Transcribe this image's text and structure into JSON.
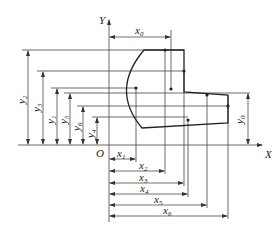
{
  "diagram": {
    "axes": {
      "x_label": "X",
      "y_label": "Y",
      "origin_label": "O"
    },
    "top_dimension": {
      "label": "x",
      "sub": "0"
    },
    "right_dimension": {
      "label": "y",
      "sub": "0"
    },
    "x_dimensions": [
      {
        "label": "x",
        "sub": "1"
      },
      {
        "label": "x",
        "sub": "2"
      },
      {
        "label": "x",
        "sub": "3"
      },
      {
        "label": "x",
        "sub": "4"
      },
      {
        "label": "x",
        "sub": "5"
      },
      {
        "label": "x",
        "sub": "6"
      }
    ],
    "y_dimensions": [
      {
        "label": "y",
        "sub": "2"
      },
      {
        "label": "y",
        "sub": "3"
      },
      {
        "label": "y",
        "sub": "1"
      },
      {
        "label": "y",
        "sub": "5"
      },
      {
        "label": "y",
        "sub": "6"
      },
      {
        "label": "y",
        "sub": "4"
      }
    ],
    "colors": {
      "line": "#333333",
      "background": "#ffffff"
    }
  }
}
